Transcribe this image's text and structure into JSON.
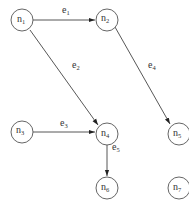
{
  "diagram": {
    "type": "directed-graph",
    "nodes": [
      {
        "id": "n1",
        "base": "n",
        "sub": "1",
        "x": 22,
        "y": 22
      },
      {
        "id": "n2",
        "base": "n",
        "sub": "2",
        "x": 107,
        "y": 19
      },
      {
        "id": "n3",
        "base": "n",
        "sub": "3",
        "x": 22,
        "y": 131
      },
      {
        "id": "n4",
        "base": "n",
        "sub": "4",
        "x": 107,
        "y": 134
      },
      {
        "id": "n5",
        "base": "n",
        "sub": "5",
        "x": 177,
        "y": 134
      },
      {
        "id": "n6",
        "base": "n",
        "sub": "6",
        "x": 107,
        "y": 188
      },
      {
        "id": "n7",
        "base": "n",
        "sub": "7",
        "x": 177,
        "y": 188
      }
    ],
    "edges": [
      {
        "id": "e1",
        "base": "e",
        "sub": "1",
        "from": "n1",
        "to": "n2"
      },
      {
        "id": "e2",
        "base": "e",
        "sub": "2",
        "from": "n1",
        "to": "n4"
      },
      {
        "id": "e3",
        "base": "e",
        "sub": "3",
        "from": "n3",
        "to": "n4"
      },
      {
        "id": "e4",
        "base": "e",
        "sub": "4",
        "from": "n2",
        "to": "n5"
      },
      {
        "id": "e5",
        "base": "e",
        "sub": "5",
        "from": "n4",
        "to": "n6"
      }
    ]
  }
}
